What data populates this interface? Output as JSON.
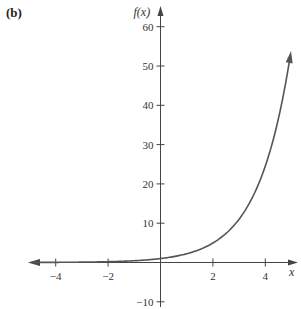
{
  "panel_label": "(b)",
  "chart_data": {
    "type": "line",
    "title": "",
    "function": "f(x) = e^(0.8x)",
    "xlabel": "x",
    "ylabel": "f(x)",
    "xlim": [
      -5,
      5
    ],
    "ylim": [
      -10,
      62
    ],
    "x_ticks": [
      -4,
      -2,
      2,
      4
    ],
    "x_tick_labels": [
      "−4",
      "−2",
      "2",
      "4"
    ],
    "y_ticks": [
      -10,
      10,
      20,
      30,
      40,
      50,
      60
    ],
    "y_tick_labels": [
      "−10",
      "10",
      "20",
      "30",
      "40",
      "50",
      "60"
    ],
    "grid": false,
    "legend": null,
    "series": [
      {
        "name": "f(x)",
        "color": "#555555",
        "x": [
          -5,
          -4,
          -3,
          -2,
          -1,
          0,
          1,
          2,
          3,
          4,
          5
        ],
        "values": [
          0.02,
          0.04,
          0.09,
          0.2,
          0.45,
          1,
          2.23,
          4.95,
          11.02,
          24.53,
          54.6
        ]
      }
    ],
    "arrows": {
      "curve_left_end": true,
      "curve_right_end": true,
      "x_axis_right": true,
      "y_axis_top": true
    }
  }
}
